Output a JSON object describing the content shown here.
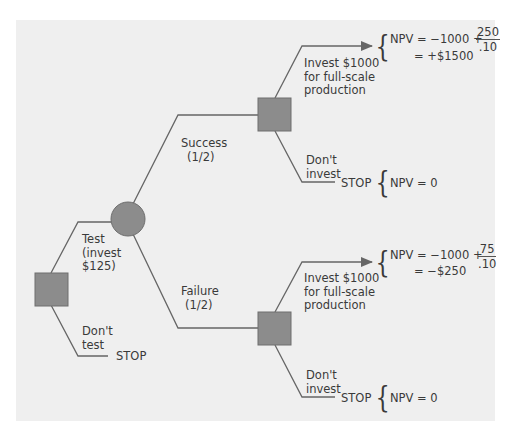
{
  "diagram": {
    "type": "decision-tree",
    "colors": {
      "background_panel": "#efefef",
      "node_fill": "#8c8c8c",
      "node_stroke": "#6e6e6e",
      "line": "#666666",
      "text": "#3a3a3a"
    },
    "root": {
      "kind": "decision-node",
      "branches": {
        "test": {
          "label_lines": [
            "Test",
            "(invest",
            "$125)"
          ]
        },
        "dont_test": {
          "label_lines": [
            "Don't",
            "test"
          ],
          "terminal": "STOP"
        }
      }
    },
    "chance": {
      "kind": "chance-node",
      "success": {
        "label_lines": [
          "Success",
          "(1/2)"
        ],
        "invest": {
          "label_lines": [
            "Invest $1000",
            "for full-scale",
            "production"
          ],
          "npv_line1_prefix": "NPV = −1000 +",
          "npv_numerator": "250",
          "npv_denominator": ".10",
          "npv_line2": "= +$1500"
        },
        "dont_invest": {
          "label_lines": [
            "Don't",
            "invest"
          ],
          "terminal": "STOP",
          "npv": "NPV = 0"
        }
      },
      "failure": {
        "label_lines": [
          "Failure",
          "(1/2)"
        ],
        "invest": {
          "label_lines": [
            "Invest $1000",
            "for full-scale",
            "production"
          ],
          "npv_line1_prefix": "NPV = −1000 +",
          "npv_numerator": "75",
          "npv_denominator": ".10",
          "npv_line2": "= −$250"
        },
        "dont_invest": {
          "label_lines": [
            "Don't",
            "invest"
          ],
          "terminal": "STOP",
          "npv": "NPV = 0"
        }
      }
    },
    "brace_glyph": "{"
  }
}
